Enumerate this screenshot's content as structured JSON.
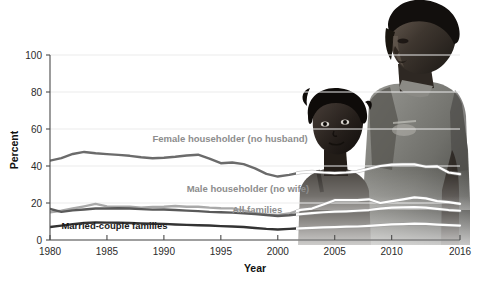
{
  "chart_data": {
    "type": "line",
    "title": "",
    "subtitle": "",
    "xlabel": "Year",
    "ylabel": "Percent",
    "xlim": [
      1980,
      2016
    ],
    "ylim": [
      0,
      100
    ],
    "grid": true,
    "legend_position": "inline-labels",
    "xticks": [
      1980,
      1985,
      1990,
      1995,
      2000,
      2005,
      2010,
      2016
    ],
    "xtick_labels": [
      "1980",
      "1985",
      "1990",
      "1995",
      "2000",
      "2005",
      "2010",
      "2016"
    ],
    "yticks": [
      0,
      20,
      40,
      60,
      80,
      100
    ],
    "ytick_labels": [
      "0",
      "20",
      "40",
      "60",
      "80",
      "100"
    ],
    "x": [
      1980,
      1981,
      1982,
      1983,
      1984,
      1985,
      1986,
      1987,
      1988,
      1989,
      1990,
      1991,
      1992,
      1993,
      1994,
      1995,
      1996,
      1997,
      1998,
      1999,
      2000,
      2001,
      2002,
      2003,
      2004,
      2005,
      2006,
      2007,
      2008,
      2009,
      2010,
      2011,
      2012,
      2013,
      2014,
      2015,
      2016
    ],
    "series": [
      {
        "name": "Female householder (no husband)",
        "color": "#6b6b6b",
        "label_x": 1989,
        "label_y": 53,
        "label_color": "gray",
        "values": [
          42.9,
          44.3,
          46.5,
          47.6,
          46.9,
          46.4,
          46.0,
          45.5,
          44.7,
          44.2,
          44.5,
          45.0,
          45.7,
          46.1,
          44.0,
          41.5,
          41.9,
          41.0,
          38.7,
          35.7,
          34.3,
          35.2,
          36.5,
          37.0,
          36.5,
          36.2,
          36.5,
          37.0,
          38.5,
          40.0,
          40.7,
          40.9,
          40.9,
          39.6,
          39.8,
          36.5,
          35.6
        ]
      },
      {
        "name": "Male householder (no wife)",
        "color": "#a9a9a9",
        "label_x": 1992,
        "label_y": 26,
        "label_color": "gray",
        "values": [
          15.0,
          15.8,
          17.0,
          18.2,
          19.5,
          18.2,
          18.0,
          18.0,
          17.5,
          17.8,
          18.0,
          18.4,
          18.0,
          18.0,
          17.5,
          17.2,
          17.1,
          16.0,
          14.5,
          13.8,
          13.5,
          14.3,
          16.3,
          17.0,
          19.2,
          21.5,
          21.5,
          21.5,
          22.0,
          20.0,
          21.0,
          22.0,
          23.0,
          22.5,
          21.0,
          20.5,
          19.5
        ]
      },
      {
        "name": "All families",
        "color": "#5a5a5a",
        "label_x": 1996,
        "label_y": 14.5,
        "label_color": "gray",
        "values": [
          16.8,
          15.2,
          16.0,
          16.5,
          17.0,
          17.0,
          17.2,
          17.0,
          16.7,
          16.4,
          16.5,
          16.2,
          15.9,
          15.6,
          15.2,
          15.0,
          14.8,
          14.5,
          14.0,
          13.5,
          13.0,
          13.4,
          14.0,
          14.5,
          15.0,
          15.3,
          15.5,
          15.8,
          16.2,
          17.0,
          17.5,
          17.6,
          17.8,
          17.5,
          16.8,
          16.2,
          15.8
        ]
      },
      {
        "name": "Married-couple families",
        "color": "#333333",
        "label_x": 1981,
        "label_y": 6.2,
        "label_color": "dark",
        "values": [
          7.0,
          7.8,
          8.6,
          9.2,
          9.5,
          9.4,
          9.3,
          9.2,
          9.0,
          8.8,
          8.7,
          8.4,
          8.2,
          8.0,
          7.8,
          7.5,
          7.3,
          7.0,
          6.5,
          6.0,
          5.7,
          6.0,
          6.3,
          6.5,
          6.8,
          7.0,
          7.2,
          7.3,
          7.6,
          8.0,
          8.4,
          8.6,
          8.8,
          8.7,
          8.3,
          8.0,
          7.8
        ]
      }
    ]
  },
  "photo": {
    "alt": "woman-and-child-photograph",
    "description": "black and white photograph of a woman and a child overlaying the right portion of the plot"
  }
}
